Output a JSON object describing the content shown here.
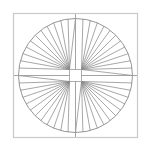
{
  "figure": {
    "type": "radial-line-figure",
    "canvas": {
      "width": 151,
      "height": 151,
      "background_color": "#ffffff"
    },
    "bounding_square": {
      "name": "outer-frame",
      "x": 13.5,
      "y": 13.5,
      "width": 124,
      "height": 124,
      "stroke_color": "#c8c8c8",
      "stroke_width": 1.2,
      "fill": "none"
    },
    "circle": {
      "name": "outer-circle",
      "center_x": 75.5,
      "center_y": 75.5,
      "radius": 57,
      "stroke_color": "#8a8a8a",
      "stroke_width": 0.9,
      "fill": "none"
    },
    "center_square": {
      "name": "hub-square",
      "center_x": 75.5,
      "center_y": 75.5,
      "half_size": 6,
      "fill_color": "#ffffff",
      "stroke_color": "#9a9a9a",
      "stroke_width": 0.8
    },
    "spokes": {
      "count": 48,
      "stroke_color": "#8a8a8a",
      "stroke_width": 0.75,
      "origin": "hub-square-corners",
      "angle_start_deg": 0,
      "angle_step_deg": 7.5,
      "description": "48 radial lines from the corners of the central square out to the circle"
    },
    "axis_lines": {
      "name": "cross-axes",
      "stroke_color": "#9a9a9a",
      "stroke_width": 0.9,
      "horizontal": {
        "x1": 13.5,
        "y1": 75.5,
        "x2": 137.5,
        "y2": 75.5
      },
      "vertical": {
        "x1": 75.5,
        "y1": 13.5,
        "x2": 75.5,
        "y2": 137.5
      }
    }
  },
  "chart_data": {
    "type": "line",
    "title": "",
    "xlabel": "",
    "ylabel": "",
    "categories": [],
    "values": [],
    "legend": [],
    "grid": false
  }
}
